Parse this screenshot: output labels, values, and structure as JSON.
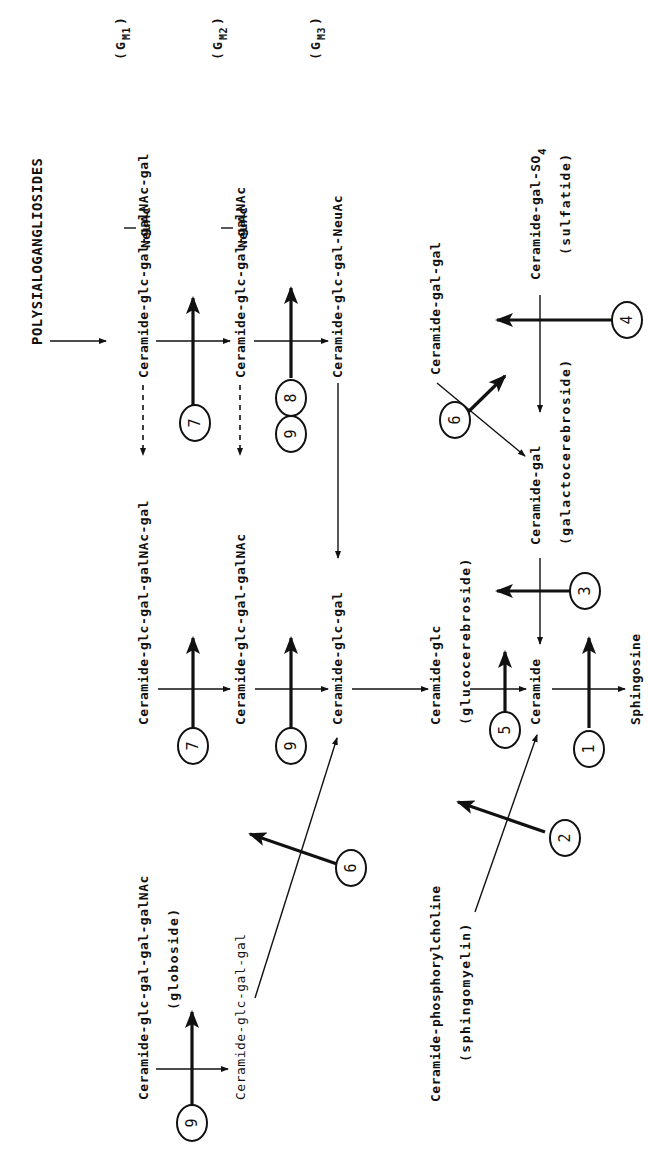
{
  "diagram": {
    "title": "POLYSIALOGANGLIOSIDES",
    "orientation": "rotated 90 degrees counter-clockwise",
    "compounds": {
      "gm1": {
        "label": "Ceramide-glc-gal-galNAc-gal",
        "branch": "NeuAc",
        "tag_base": "G",
        "tag_sub": "M1"
      },
      "gm2": {
        "label": "Ceramide-glc-gal-galNAc",
        "branch": "NeuAc",
        "tag_base": "G",
        "tag_sub": "M2"
      },
      "gm3": {
        "label": "Ceramide-glc-gal-NeuAc",
        "tag_base": "G",
        "tag_sub": "M3"
      },
      "neutral_tetra": {
        "label": "Ceramide-glc-gal-galNAc-gal"
      },
      "neutral_tri": {
        "label": "Ceramide-glc-gal-galNAc"
      },
      "lactosylceramide": {
        "label": "Ceramide-glc-gal"
      },
      "glucocerebroside": {
        "label": "Ceramide-glc",
        "note": "(glucocerebroside)"
      },
      "ceramide": {
        "label": "Ceramide"
      },
      "sphingosine": {
        "label": "Sphingosine"
      },
      "digalactosyl": {
        "label": "Ceramide-gal-gal"
      },
      "galactocerebroside": {
        "label": "Ceramide-gal",
        "note": "(galactocerebroside)"
      },
      "sulfatide": {
        "label": "Ceramide-gal-SO",
        "label_sub": "4",
        "note": "(sulfatide)"
      },
      "globoside": {
        "label": "Ceramide-glc-gal-gal-galNAc",
        "note": "(globoside)"
      },
      "trihexosyl": {
        "label": "Ceramide-glc-gal-gal"
      },
      "sphingomyelin": {
        "label": "Ceramide-phosphorylcholine",
        "note": "(sphingomyelin)"
      }
    },
    "enzymes": [
      {
        "id": "e1",
        "number": "1",
        "between": "Ceramide -> Sphingosine"
      },
      {
        "id": "e2",
        "number": "2",
        "between": "Sphingomyelin -> Ceramide"
      },
      {
        "id": "e3",
        "number": "3",
        "between": "Ceramide-gal -> Ceramide"
      },
      {
        "id": "e4",
        "number": "4",
        "between": "Ceramide-gal-SO4 -> Ceramide-gal"
      },
      {
        "id": "e5",
        "number": "5",
        "between": "Ceramide-glc -> Ceramide"
      },
      {
        "id": "e6a",
        "number": "6",
        "between": "Ceramide-gal-gal -> Ceramide-gal"
      },
      {
        "id": "e6b",
        "number": "6",
        "between": "Ceramide-glc-gal-gal -> Ceramide-glc-gal"
      },
      {
        "id": "e7a",
        "number": "7",
        "between": "Ceramide-glc-gal-galNAc-gal -> Ceramide-glc-gal-galNAc"
      },
      {
        "id": "e7b",
        "number": "7",
        "between": "GM1 -> GM2"
      },
      {
        "id": "e8",
        "number": "8",
        "between": "GM2 -> GM3"
      },
      {
        "id": "e9a",
        "number": "9",
        "between": "GM2 -> GM3"
      },
      {
        "id": "e9b",
        "number": "9",
        "between": "Ceramide-glc-gal-galNAc -> Ceramide-glc-gal"
      },
      {
        "id": "e9c",
        "number": "9",
        "between": "Globoside -> Ceramide-glc-gal-gal"
      }
    ]
  }
}
